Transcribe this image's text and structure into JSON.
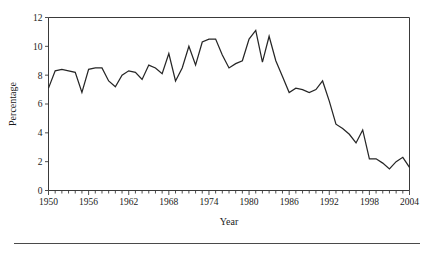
{
  "figure": {
    "name": "percentage-by-year-line-chart"
  },
  "chart_data": {
    "type": "line",
    "title": "",
    "xlabel": "Year",
    "ylabel": "Percentage",
    "xlim": [
      1950,
      2004
    ],
    "ylim": [
      0,
      12
    ],
    "grid": false,
    "legend": "none",
    "x_tick_labels": [
      "1950",
      "1956",
      "1962",
      "1968",
      "1974",
      "1980",
      "1986",
      "1992",
      "1998",
      "2004"
    ],
    "x_tick_values": [
      1950,
      1956,
      1962,
      1968,
      1974,
      1980,
      1986,
      1992,
      1998,
      2004
    ],
    "x_minor_tick_interval": 1,
    "y_tick_labels": [
      "0",
      "2",
      "4",
      "6",
      "8",
      "10",
      "12"
    ],
    "y_tick_values": [
      0,
      2,
      4,
      6,
      8,
      10,
      12
    ],
    "series": [
      {
        "name": "Percentage",
        "color": "#262626",
        "x": [
          1950,
          1951,
          1952,
          1953,
          1954,
          1955,
          1956,
          1957,
          1958,
          1959,
          1960,
          1961,
          1962,
          1963,
          1964,
          1965,
          1966,
          1967,
          1968,
          1969,
          1970,
          1971,
          1972,
          1973,
          1974,
          1975,
          1976,
          1977,
          1978,
          1979,
          1980,
          1981,
          1982,
          1983,
          1984,
          1985,
          1986,
          1987,
          1988,
          1989,
          1990,
          1991,
          1992,
          1993,
          1994,
          1995,
          1996,
          1997,
          1998,
          1999,
          2000,
          2001,
          2002,
          2003,
          2004
        ],
        "values": [
          7.1,
          8.3,
          8.4,
          8.3,
          8.2,
          6.8,
          8.4,
          8.5,
          8.5,
          7.6,
          7.2,
          8.0,
          8.3,
          8.2,
          7.7,
          8.7,
          8.5,
          8.1,
          9.5,
          7.6,
          8.5,
          10.0,
          8.7,
          10.3,
          10.5,
          10.5,
          9.4,
          8.5,
          8.8,
          9.0,
          10.5,
          11.1,
          8.9,
          10.7,
          9.0,
          7.9,
          6.8,
          7.1,
          7.0,
          6.8,
          7.0,
          7.6,
          6.2,
          4.6,
          4.3,
          3.9,
          3.3,
          4.2,
          2.2,
          2.2,
          1.9,
          1.5,
          2.0,
          2.3,
          1.6
        ]
      }
    ]
  },
  "labels": {
    "y_axis_title": "Percentage",
    "x_axis_title": "Year"
  },
  "colors": {
    "line": "#262626",
    "axis": "#3a3a3a",
    "rule": "#4a4a4a",
    "background": "#ffffff"
  }
}
